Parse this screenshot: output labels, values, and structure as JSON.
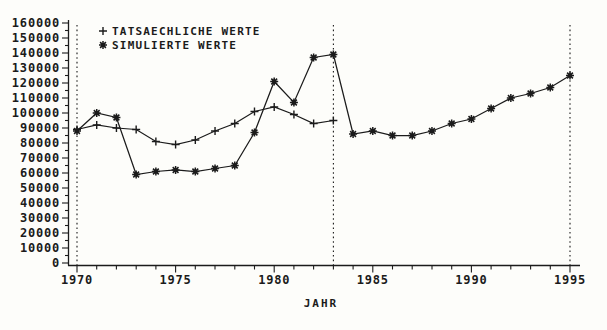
{
  "figure": {
    "background": "#fdfdfa",
    "ink_color": "#1b1b1b"
  },
  "chart_data": {
    "type": "line",
    "title": "",
    "xlabel": "JAHR",
    "ylabel": "",
    "xlim": [
      1970,
      1995
    ],
    "ylim": [
      0,
      160000
    ],
    "y_major_tick_step": 10000,
    "y_minor_tick_step": 5000,
    "x_major_ticks": [
      1970,
      1975,
      1980,
      1985,
      1990,
      1995
    ],
    "x_minor_tick_step": 1,
    "dashed_vlines_at_x": [
      1970,
      1983,
      1995
    ],
    "grid": false,
    "legend_position": "top-left",
    "series": [
      {
        "name": "TATSAECHLICHE WERTE",
        "marker": "+",
        "x": [
          1970,
          1971,
          1972,
          1973,
          1974,
          1975,
          1976,
          1977,
          1978,
          1979,
          1980,
          1981,
          1982,
          1983
        ],
        "values": [
          89000,
          92000,
          90000,
          89000,
          81000,
          79000,
          82000,
          88000,
          93000,
          101000,
          104000,
          99000,
          93000,
          95000
        ]
      },
      {
        "name": "SIMULIERTE WERTE",
        "marker": "*",
        "x": [
          1970,
          1971,
          1972,
          1973,
          1974,
          1975,
          1976,
          1977,
          1978,
          1979,
          1980,
          1981,
          1982,
          1983,
          1984,
          1985,
          1986,
          1987,
          1988,
          1989,
          1990,
          1991,
          1992,
          1993,
          1994,
          1995
        ],
        "values": [
          88000,
          100000,
          97000,
          59000,
          61000,
          62000,
          61000,
          63000,
          65000,
          87000,
          121000,
          107000,
          137000,
          139000,
          86000,
          88000,
          85000,
          85000,
          88000,
          93000,
          96000,
          103000,
          110000,
          113000,
          117000,
          125000
        ]
      }
    ]
  }
}
